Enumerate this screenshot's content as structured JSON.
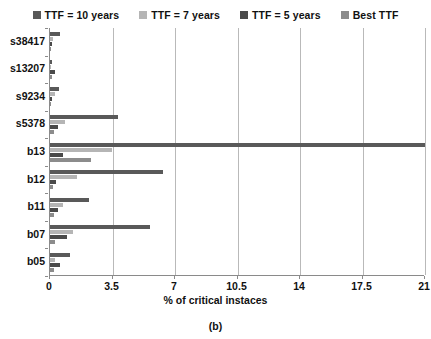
{
  "caption": "(b)",
  "chart_data": {
    "type": "bar",
    "orientation": "horizontal",
    "title": "",
    "subtitle": "",
    "xlabel": "% of critical instaces",
    "ylabel": "",
    "xlim": [
      0,
      21
    ],
    "xticks": [
      "0",
      "3.5",
      "7",
      "10.5",
      "14",
      "17.5",
      "21"
    ],
    "xtick_values": [
      0,
      3.5,
      7,
      10.5,
      14,
      17.5,
      21
    ],
    "grid": "vertical",
    "legend_position": "top",
    "categories": [
      "s38417",
      "s13207",
      "s9234",
      "s5378",
      "b13",
      "b12",
      "b11",
      "b07",
      "b05"
    ],
    "series": [
      {
        "name": "TTF = 10 years",
        "color": "#595959",
        "values": [
          0.55,
          0.12,
          0.5,
          3.8,
          21.0,
          6.3,
          2.2,
          5.6,
          1.1
        ]
      },
      {
        "name": "TTF = 7 years",
        "color": "#b5b5b5",
        "values": [
          0.18,
          0.05,
          0.3,
          0.85,
          3.45,
          1.5,
          0.72,
          1.3,
          0.3
        ]
      },
      {
        "name": "TTF = 5 years",
        "color": "#4a4a4a",
        "values": [
          0.1,
          0.28,
          0.1,
          0.42,
          0.7,
          0.35,
          0.45,
          0.95,
          0.55
        ]
      },
      {
        "name": "Best TTF",
        "color": "#8c8c8c",
        "values": [
          0.06,
          0.1,
          0.06,
          0.2,
          2.3,
          0.18,
          0.2,
          0.3,
          0.2
        ]
      }
    ]
  },
  "axis": {
    "line_color": "#8a8a8a",
    "grid_color": "#b9b9b9"
  }
}
